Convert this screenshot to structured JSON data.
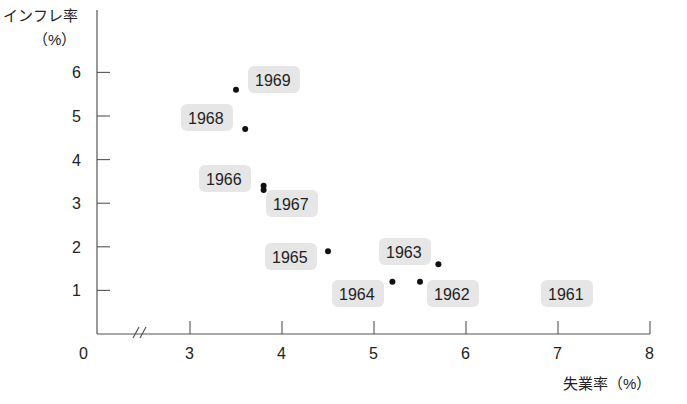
{
  "chart_data": {
    "type": "scatter",
    "title": "",
    "xlabel": "失業率（%）",
    "ylabel": "インフレ率（%）",
    "ylabel_lines": [
      "インフレ率",
      "（%）"
    ],
    "origin_label": "0",
    "x_axis_break": true,
    "xlim": [
      3,
      8
    ],
    "ylim": [
      0,
      6
    ],
    "x_ticks": [
      "3",
      "4",
      "5",
      "6",
      "7",
      "8"
    ],
    "y_ticks": [
      "1",
      "2",
      "3",
      "4",
      "5",
      "6"
    ],
    "grid": false,
    "legend": null,
    "points": [
      {
        "label": "1961",
        "x": 6.7,
        "y": 1.0,
        "dot_visible": false
      },
      {
        "label": "1962",
        "x": 5.5,
        "y": 1.2,
        "dot_visible": true
      },
      {
        "label": "1963",
        "x": 5.7,
        "y": 1.6,
        "dot_visible": true
      },
      {
        "label": "1964",
        "x": 5.2,
        "y": 1.2,
        "dot_visible": true
      },
      {
        "label": "1965",
        "x": 4.5,
        "y": 1.9,
        "dot_visible": true
      },
      {
        "label": "1966",
        "x": 3.8,
        "y": 3.4,
        "dot_visible": true
      },
      {
        "label": "1967",
        "x": 3.8,
        "y": 3.3,
        "dot_visible": true
      },
      {
        "label": "1968",
        "x": 3.6,
        "y": 4.7,
        "dot_visible": true
      },
      {
        "label": "1969",
        "x": 3.5,
        "y": 5.6,
        "dot_visible": true
      }
    ]
  },
  "colors": {
    "axis": "#555555",
    "dot": "#111111",
    "label_bg": "#e6e6e6",
    "text": "#222222"
  }
}
